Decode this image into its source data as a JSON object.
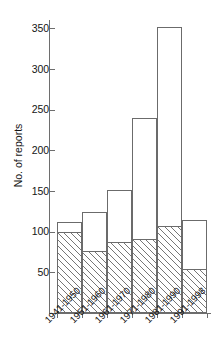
{
  "chart_data": {
    "type": "bar",
    "title": "",
    "xlabel": "",
    "ylabel": "No. of reports",
    "categories": [
      "1941-1950",
      "1951-1960",
      "1961-1970",
      "1971-1980",
      "1981-1990",
      "1991-1998"
    ],
    "series": [
      {
        "name": "total",
        "style": "open",
        "values": [
          112,
          124,
          151,
          240,
          352,
          114
        ]
      },
      {
        "name": "hatched",
        "style": "hatched",
        "values": [
          100,
          76,
          87,
          91,
          107,
          54
        ]
      }
    ],
    "yticks": [
      50,
      100,
      150,
      200,
      250,
      300,
      350
    ],
    "ytick_labels": [
      "50",
      "100",
      "150",
      "200",
      "250",
      "300",
      "350"
    ],
    "ylim": [
      0,
      360
    ],
    "grid": false,
    "legend": "none"
  },
  "axis": {
    "y_title": "No. of reports",
    "t350": "350",
    "t300": "300",
    "t250": "250",
    "t200": "200",
    "t150": "150",
    "t100": "100",
    "t50": "50"
  },
  "xlabels": {
    "c0": "1941-1950",
    "c1": "1951-1960",
    "c2": "1961-1970",
    "c3": "1971-1980",
    "c4": "1981-1990",
    "c5": "1991-1998"
  },
  "colors": {
    "axis": "#6e6e6e",
    "bar_outline": "#6b6b6b",
    "hatch": "#767676",
    "background": "#ffffff",
    "text": "#141414"
  }
}
